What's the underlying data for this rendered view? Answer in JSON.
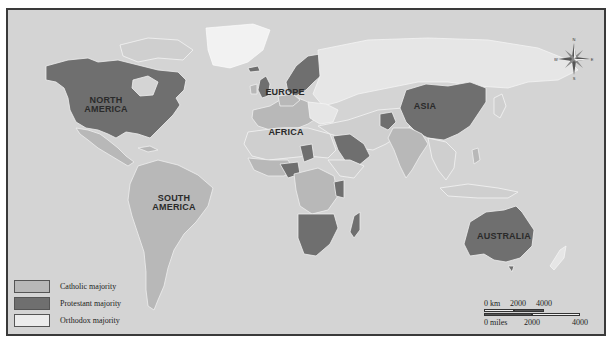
{
  "map": {
    "title": "World religious majority map (Christian denominations)",
    "regions": [
      {
        "id": "north-america",
        "label_line1": "NORTH",
        "label_line2": "AMERICA"
      },
      {
        "id": "south-america",
        "label_line1": "SOUTH",
        "label_line2": "AMERICA"
      },
      {
        "id": "europe",
        "label_line1": "EUROPE",
        "label_line2": ""
      },
      {
        "id": "africa",
        "label_line1": "AFRICA",
        "label_line2": ""
      },
      {
        "id": "asia",
        "label_line1": "ASIA",
        "label_line2": ""
      },
      {
        "id": "australia",
        "label_line1": "AUSTRALIA",
        "label_line2": ""
      }
    ],
    "colors": {
      "background": "#d4d4d4",
      "catholic": "#b8b8b8",
      "protestant": "#6f6f6f",
      "orthodox": "#e6e6e6",
      "border": "#3a3a3a"
    }
  },
  "legend": {
    "items": [
      {
        "label": "Catholic majority",
        "color": "#b8b8b8"
      },
      {
        "label": "Protestant majority",
        "color": "#6f6f6f"
      },
      {
        "label": "Orthodox majority",
        "color": "#ececec"
      }
    ]
  },
  "scale": {
    "km_labels": [
      "0 km",
      "2000",
      "4000"
    ],
    "mile_labels": [
      "0 miles",
      "2000",
      "4000"
    ]
  },
  "compass": {
    "n": "N",
    "s": "S",
    "e": "E",
    "w": "W"
  }
}
